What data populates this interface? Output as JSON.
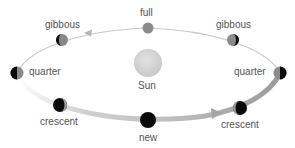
{
  "diagram": {
    "sun": {
      "label": "Sun",
      "color": "#d4d4d4"
    },
    "phases": [
      {
        "id": "full",
        "label": "full"
      },
      {
        "id": "gibbous-left",
        "label": "gibbous"
      },
      {
        "id": "gibbous-right",
        "label": "gibbous"
      },
      {
        "id": "quarter-left",
        "label": "quarter"
      },
      {
        "id": "quarter-right",
        "label": "quarter"
      },
      {
        "id": "crescent-left",
        "label": "crescent"
      },
      {
        "id": "crescent-right",
        "label": "crescent"
      },
      {
        "id": "new",
        "label": "new"
      }
    ],
    "colors": {
      "orbit": "#c8c8c8",
      "orbit_band": "#bfbfbf",
      "moon_dark": "#0b0b0b",
      "moon_lit": "#8a8a8a",
      "label": "#555555"
    }
  }
}
